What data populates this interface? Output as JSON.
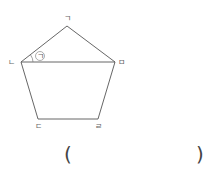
{
  "header": {
    "cut_text": ""
  },
  "figure": {
    "shape": "pentagon",
    "vertices": {
      "a": {
        "label": "ㄱ",
        "x": 67,
        "y": 26
      },
      "b": {
        "label": "ㄴ",
        "x": 21,
        "y": 62
      },
      "c": {
        "label": "ㄷ",
        "x": 38,
        "y": 119
      },
      "d": {
        "label": "ㄹ",
        "x": 98,
        "y": 119
      },
      "e": {
        "label": "ㅁ",
        "x": 115,
        "y": 62
      }
    },
    "diagonal": "ㄴㅁ",
    "angle_mark": "㉠",
    "line_color": "#555555"
  },
  "answer": {
    "open_paren": "(",
    "close_paren": ")",
    "value": ""
  }
}
